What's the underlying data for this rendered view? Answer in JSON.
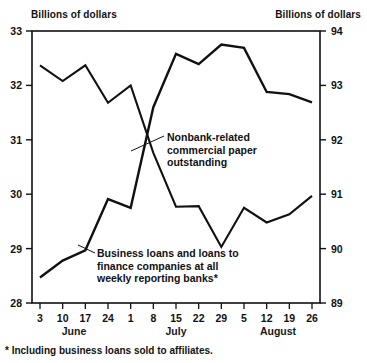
{
  "axis_titles": {
    "left": "Billions of dollars",
    "right": "Billions of dollars"
  },
  "footnote": "* Including business loans sold to affiliates.",
  "annotations": {
    "commercial_paper": [
      "Nonbank-related",
      "commercial paper",
      "outstanding"
    ],
    "business_loans": [
      "Business loans and loans to",
      "finance companies at all",
      "weekly reporting banks*"
    ]
  },
  "chart_data": {
    "type": "line",
    "title": "",
    "xlabel": "",
    "ylabel": "Billions of dollars",
    "grid": false,
    "legend": "annotations-inline",
    "x": [
      "3",
      "10",
      "17",
      "24",
      "1",
      "8",
      "15",
      "22",
      "29",
      "5",
      "12",
      "19",
      "26"
    ],
    "x_months": [
      {
        "label": "June",
        "start_index": 0,
        "end_index": 3
      },
      {
        "label": "July",
        "start_index": 4,
        "end_index": 8
      },
      {
        "label": "August",
        "start_index": 9,
        "end_index": 12
      }
    ],
    "left_axis": {
      "label": "Billions of dollars",
      "ticks": [
        28,
        29,
        30,
        31,
        32,
        33
      ],
      "ylim": [
        28,
        33
      ],
      "tick_labels": [
        "28",
        "29",
        "30",
        "31",
        "32",
        "33"
      ]
    },
    "right_axis": {
      "label": "Billions of dollars",
      "ticks": [
        89,
        90,
        91,
        92,
        93,
        94
      ],
      "ylim": [
        89,
        94
      ],
      "tick_labels": [
        "89",
        "90",
        "91",
        "92",
        "93",
        "94"
      ]
    },
    "series": [
      {
        "name": "Nonbank-related commercial paper outstanding",
        "axis": "left",
        "units": "billions of dollars",
        "color": "#111111",
        "values": [
          32.37,
          32.08,
          32.37,
          31.68,
          32.0,
          30.76,
          29.77,
          29.78,
          29.03,
          29.75,
          29.48,
          29.63,
          29.97
        ]
      },
      {
        "name": "Business loans and loans to finance companies at all weekly reporting banks",
        "axis": "right",
        "units": "billions of dollars",
        "color": "#111111",
        "values": [
          89.47,
          89.78,
          89.97,
          90.91,
          90.75,
          92.6,
          93.58,
          93.39,
          93.75,
          93.69,
          92.88,
          92.84,
          92.69
        ],
        "values_left_scale": [
          28.47,
          28.78,
          28.97,
          30.91,
          30.75,
          32.6,
          33.58,
          33.39,
          33.75,
          33.69,
          32.88,
          32.84,
          32.69
        ]
      }
    ]
  }
}
